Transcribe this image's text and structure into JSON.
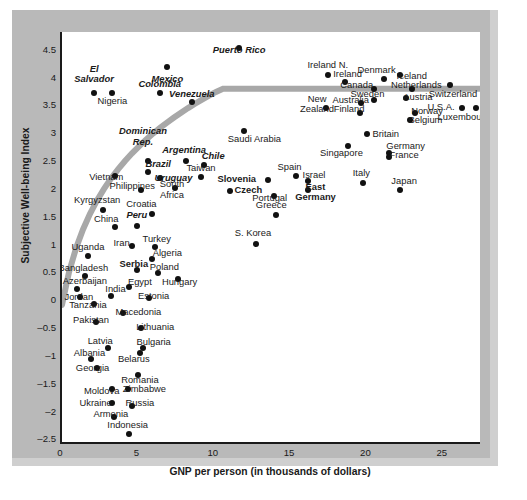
{
  "chart_data": {
    "type": "scatter",
    "title": "",
    "xlabel": "GNP per person (in thousands of dollars)",
    "ylabel": "Subjective Well-being Index",
    "xlim": [
      0,
      27.5
    ],
    "ylim": [
      -2.6,
      4.8
    ],
    "xticks": [
      0,
      5,
      10,
      15,
      20,
      25
    ],
    "yticks": [
      4.5,
      4,
      3.5,
      3,
      2.5,
      2,
      1.5,
      1,
      0.5,
      0,
      -0.5,
      -1,
      -1.5,
      -2,
      -2.5
    ],
    "grid": false,
    "legend": false,
    "trend_line": {
      "description": "logarithmic fit curve",
      "color": "#a8a8a8",
      "width": 6
    },
    "points": [
      {
        "label": "Puerto Rico",
        "x": 11.6,
        "y": 4.52,
        "style": "it",
        "lx": 11.6,
        "ly": 4.38,
        "align": "c",
        "lines": 2
      },
      {
        "label": "Mexico",
        "x": 6.9,
        "y": 4.18,
        "style": "it",
        "lx": 6.9,
        "ly": 3.96,
        "align": "c",
        "lines": 1
      },
      {
        "label": "El\nSalvador",
        "x": 2.1,
        "y": 3.7,
        "style": "it",
        "lx": 2.1,
        "ly": 4.04,
        "align": "c",
        "lines": 2
      },
      {
        "label": "Nigeria",
        "x": 3.3,
        "y": 3.7,
        "style": "",
        "lx": 3.3,
        "ly": 3.55,
        "align": "c",
        "lines": 1
      },
      {
        "label": "Colombia",
        "x": 6.4,
        "y": 3.7,
        "style": "it",
        "lx": 6.4,
        "ly": 3.86,
        "align": "c",
        "lines": 1
      },
      {
        "label": "Venezuela",
        "x": 8.5,
        "y": 3.54,
        "style": "it",
        "lx": 8.5,
        "ly": 3.69,
        "align": "c",
        "lines": 1
      },
      {
        "label": "Ireland N.",
        "x": 17.4,
        "y": 4.02,
        "style": "",
        "lx": 17.4,
        "ly": 4.2,
        "align": "c",
        "lines": 1
      },
      {
        "label": "Ireland",
        "x": 18.5,
        "y": 3.9,
        "style": "",
        "lx": 18.7,
        "ly": 4.04,
        "align": "c",
        "lines": 1
      },
      {
        "label": "Denmark",
        "x": 21.1,
        "y": 3.95,
        "style": "",
        "lx": 20.6,
        "ly": 4.11,
        "align": "c",
        "lines": 1
      },
      {
        "label": "Iceland",
        "x": 22.1,
        "y": 4.02,
        "style": "",
        "lx": 22.9,
        "ly": 4.01,
        "align": "c",
        "lines": 1
      },
      {
        "label": "Canada",
        "x": 20.4,
        "y": 3.78,
        "style": "",
        "lx": 19.3,
        "ly": 3.84,
        "align": "c",
        "lines": 1
      },
      {
        "label": "Netherlands",
        "x": 22.9,
        "y": 3.78,
        "style": "",
        "lx": 23.2,
        "ly": 3.84,
        "align": "c",
        "lines": 1
      },
      {
        "label": "Switzerland",
        "x": 25.4,
        "y": 3.84,
        "style": "",
        "lx": 25.6,
        "ly": 3.68,
        "align": "c",
        "lines": 1
      },
      {
        "label": "Sweden",
        "x": 20.4,
        "y": 3.58,
        "style": "",
        "lx": 20.0,
        "ly": 3.68,
        "align": "c",
        "lines": 1
      },
      {
        "label": "Austria",
        "x": 22.5,
        "y": 3.62,
        "style": "",
        "lx": 23.3,
        "ly": 3.62,
        "align": "c",
        "lines": 1
      },
      {
        "label": "Australia",
        "x": 19.6,
        "y": 3.52,
        "style": "",
        "lx": 18.9,
        "ly": 3.57,
        "align": "c",
        "lines": 1
      },
      {
        "label": "New\nZealand",
        "x": 17.3,
        "y": 3.44,
        "style": "",
        "lx": 16.7,
        "ly": 3.5,
        "align": "c",
        "lines": 2
      },
      {
        "label": "Finland",
        "x": 19.5,
        "y": 3.34,
        "style": "",
        "lx": 18.8,
        "ly": 3.41,
        "align": "c",
        "lines": 1
      },
      {
        "label": "U.S.A.",
        "x": 26.2,
        "y": 3.44,
        "style": "",
        "lx": 25.7,
        "ly": 3.44,
        "align": "r",
        "lines": 1
      },
      {
        "label": "Norway",
        "x": 23.1,
        "y": 3.34,
        "style": "",
        "lx": 23.9,
        "ly": 3.37,
        "align": "c",
        "lines": 1
      },
      {
        "label": "Luxembourg",
        "x": 27.1,
        "y": 3.44,
        "style": "",
        "lx": 26.3,
        "ly": 3.26,
        "align": "c",
        "lines": 1
      },
      {
        "label": "Belgium",
        "x": 22.8,
        "y": 3.22,
        "style": "",
        "lx": 23.8,
        "ly": 3.22,
        "align": "c",
        "lines": 1
      },
      {
        "label": "Saudi Arabia",
        "x": 11.9,
        "y": 3.02,
        "style": "",
        "lx": 12.6,
        "ly": 2.88,
        "align": "c",
        "lines": 1
      },
      {
        "label": "Britain",
        "x": 20.0,
        "y": 2.96,
        "style": "",
        "lx": 21.2,
        "ly": 2.97,
        "align": "c",
        "lines": 1
      },
      {
        "label": "Singapore",
        "x": 18.7,
        "y": 2.76,
        "style": "",
        "lx": 18.3,
        "ly": 2.63,
        "align": "c",
        "lines": 1
      },
      {
        "label": "Germany",
        "x": 21.4,
        "y": 2.62,
        "style": "",
        "lx": 22.5,
        "ly": 2.74,
        "align": "c",
        "lines": 1
      },
      {
        "label": "France",
        "x": 21.4,
        "y": 2.56,
        "style": "",
        "lx": 22.4,
        "ly": 2.58,
        "align": "c",
        "lines": 1
      },
      {
        "label": "Dominican\nRep.",
        "x": 5.6,
        "y": 2.48,
        "style": "it",
        "lx": 5.3,
        "ly": 2.92,
        "align": "c",
        "lines": 2
      },
      {
        "label": "Argentina",
        "x": 8.1,
        "y": 2.48,
        "style": "it",
        "lx": 8.0,
        "ly": 2.68,
        "align": "c",
        "lines": 1
      },
      {
        "label": "Chile",
        "x": 9.3,
        "y": 2.42,
        "style": "it",
        "lx": 9.9,
        "ly": 2.57,
        "align": "c",
        "lines": 1
      },
      {
        "label": "Brazil",
        "x": 5.6,
        "y": 2.28,
        "style": "it",
        "lx": 6.3,
        "ly": 2.42,
        "align": "c",
        "lines": 1
      },
      {
        "label": "Taiwan",
        "x": 9.1,
        "y": 2.2,
        "style": "",
        "lx": 9.1,
        "ly": 2.35,
        "align": "c",
        "lines": 1
      },
      {
        "label": "Vietnam",
        "x": 3.5,
        "y": 2.22,
        "style": "",
        "lx": 2.9,
        "ly": 2.19,
        "align": "c",
        "lines": 1
      },
      {
        "label": "Uruguay",
        "x": 6.4,
        "y": 2.18,
        "style": "it",
        "lx": 7.3,
        "ly": 2.18,
        "align": "c",
        "lines": 1
      },
      {
        "label": "Spain",
        "x": 15.3,
        "y": 2.22,
        "style": "",
        "lx": 14.9,
        "ly": 2.37,
        "align": "c",
        "lines": 1
      },
      {
        "label": "Slovenia",
        "x": 13.5,
        "y": 2.14,
        "style": "bd",
        "lx": 12.7,
        "ly": 2.15,
        "align": "r",
        "lines": 1
      },
      {
        "label": "Israel",
        "x": 16.1,
        "y": 2.12,
        "style": "",
        "lx": 16.5,
        "ly": 2.23,
        "align": "c",
        "lines": 1
      },
      {
        "label": "Italy",
        "x": 19.7,
        "y": 2.08,
        "style": "",
        "lx": 19.6,
        "ly": 2.26,
        "align": "c",
        "lines": 1
      },
      {
        "label": "Japan",
        "x": 22.1,
        "y": 1.96,
        "style": "",
        "lx": 22.4,
        "ly": 2.12,
        "align": "c",
        "lines": 1
      },
      {
        "label": "Philippines",
        "x": 5.2,
        "y": 1.96,
        "style": "",
        "lx": 4.6,
        "ly": 2.03,
        "align": "c",
        "lines": 1
      },
      {
        "label": "South\nAfrica",
        "x": 7.4,
        "y": 2.0,
        "style": "",
        "lx": 7.2,
        "ly": 1.97,
        "align": "c",
        "lines": 2
      },
      {
        "label": "Czech",
        "x": 11.0,
        "y": 1.95,
        "style": "bd",
        "lx": 11.3,
        "ly": 1.95,
        "align": "",
        "lines": 1
      },
      {
        "label": "Portugal",
        "x": 13.9,
        "y": 1.86,
        "style": "",
        "lx": 13.6,
        "ly": 1.81,
        "align": "c",
        "lines": 1
      },
      {
        "label": "East\nGermany",
        "x": 16.1,
        "y": 1.96,
        "style": "bd",
        "lx": 16.6,
        "ly": 1.92,
        "align": "c",
        "lines": 2
      },
      {
        "label": "Kyrgyzstan",
        "x": 2.7,
        "y": 1.6,
        "style": "",
        "lx": 2.3,
        "ly": 1.78,
        "align": "c",
        "lines": 1
      },
      {
        "label": "Croatia",
        "x": 5.9,
        "y": 1.54,
        "style": "",
        "lx": 5.2,
        "ly": 1.71,
        "align": "c",
        "lines": 1
      },
      {
        "label": "Greece",
        "x": 14.0,
        "y": 1.52,
        "style": "",
        "lx": 13.7,
        "ly": 1.68,
        "align": "c",
        "lines": 1
      },
      {
        "label": "China",
        "x": 3.5,
        "y": 1.3,
        "style": "",
        "lx": 2.9,
        "ly": 1.44,
        "align": "c",
        "lines": 1
      },
      {
        "label": "Peru",
        "x": 4.9,
        "y": 1.32,
        "style": "it",
        "lx": 4.9,
        "ly": 1.5,
        "align": "c",
        "lines": 1
      },
      {
        "label": "S. Korea",
        "x": 12.7,
        "y": 1.0,
        "style": "",
        "lx": 12.5,
        "ly": 1.18,
        "align": "c",
        "lines": 1
      },
      {
        "label": "Iran",
        "x": 4.6,
        "y": 0.96,
        "style": "",
        "lx": 3.9,
        "ly": 1.0,
        "align": "c",
        "lines": 1
      },
      {
        "label": "Turkey",
        "x": 6.1,
        "y": 0.94,
        "style": "",
        "lx": 6.2,
        "ly": 1.08,
        "align": "c",
        "lines": 1
      },
      {
        "label": "Uganda",
        "x": 1.7,
        "y": 0.78,
        "style": "",
        "lx": 1.7,
        "ly": 0.94,
        "align": "c",
        "lines": 1
      },
      {
        "label": "Algeria",
        "x": 5.9,
        "y": 0.72,
        "style": "",
        "lx": 6.9,
        "ly": 0.82,
        "align": "c",
        "lines": 1
      },
      {
        "label": "Serbia",
        "x": 4.9,
        "y": 0.52,
        "style": "bd",
        "lx": 4.7,
        "ly": 0.63,
        "align": "c",
        "lines": 1
      },
      {
        "label": "Bangladesh",
        "x": 1.5,
        "y": 0.42,
        "style": "",
        "lx": 1.4,
        "ly": 0.56,
        "align": "c",
        "lines": 1
      },
      {
        "label": "Poland",
        "x": 6.3,
        "y": 0.48,
        "style": "",
        "lx": 6.7,
        "ly": 0.58,
        "align": "c",
        "lines": 1
      },
      {
        "label": "Hungary",
        "x": 7.6,
        "y": 0.36,
        "style": "",
        "lx": 7.7,
        "ly": 0.3,
        "align": "c",
        "lines": 1
      },
      {
        "label": "Azerbaijan",
        "x": 1.0,
        "y": 0.18,
        "style": "",
        "lx": 1.5,
        "ly": 0.32,
        "align": "c",
        "lines": 1
      },
      {
        "label": "Egypt",
        "x": 4.4,
        "y": 0.22,
        "style": "",
        "lx": 5.1,
        "ly": 0.3,
        "align": "c",
        "lines": 1
      },
      {
        "label": "India",
        "x": 3.2,
        "y": 0.06,
        "style": "",
        "lx": 3.5,
        "ly": 0.18,
        "align": "c",
        "lines": 1
      },
      {
        "label": "Jordan",
        "x": 1.2,
        "y": 0.04,
        "style": "",
        "lx": 1.1,
        "ly": 0.03,
        "align": "c",
        "lines": 1
      },
      {
        "label": "Estonia",
        "x": 5.7,
        "y": 0.03,
        "style": "",
        "lx": 6.0,
        "ly": 0.06,
        "align": "c",
        "lines": 1
      },
      {
        "label": "Tanzania",
        "x": 2.1,
        "y": -0.08,
        "style": "",
        "lx": 1.7,
        "ly": -0.1,
        "align": "c",
        "lines": 1
      },
      {
        "label": "Macedonia",
        "x": 4.0,
        "y": -0.24,
        "style": "",
        "lx": 5.0,
        "ly": -0.23,
        "align": "c",
        "lines": 1
      },
      {
        "label": "Pakistan",
        "x": 2.2,
        "y": -0.4,
        "style": "",
        "lx": 1.9,
        "ly": -0.38,
        "align": "c",
        "lines": 1
      },
      {
        "label": "Lithuania",
        "x": 5.2,
        "y": -0.52,
        "style": "",
        "lx": 6.1,
        "ly": -0.51,
        "align": "c",
        "lines": 1
      },
      {
        "label": "Latvia",
        "x": 3.0,
        "y": -0.88,
        "style": "",
        "lx": 2.5,
        "ly": -0.75,
        "align": "c",
        "lines": 1
      },
      {
        "label": "Bulgaria",
        "x": 5.3,
        "y": -0.88,
        "style": "",
        "lx": 6.0,
        "ly": -0.77,
        "align": "c",
        "lines": 1
      },
      {
        "label": "Albania",
        "x": 1.9,
        "y": -1.08,
        "style": "",
        "lx": 1.8,
        "ly": -0.97,
        "align": "c",
        "lines": 1
      },
      {
        "label": "Belarus",
        "x": 5.1,
        "y": -0.96,
        "style": "",
        "lx": 4.7,
        "ly": -1.08,
        "align": "c",
        "lines": 1
      },
      {
        "label": "Georgia",
        "x": 2.3,
        "y": -1.24,
        "style": "",
        "lx": 2.0,
        "ly": -1.24,
        "align": "c",
        "lines": 1
      },
      {
        "label": "Romania",
        "x": 5.0,
        "y": -1.36,
        "style": "",
        "lx": 5.1,
        "ly": -1.46,
        "align": "c",
        "lines": 1
      },
      {
        "label": "Zimbabwe",
        "x": 4.3,
        "y": -1.62,
        "style": "",
        "lx": 5.4,
        "ly": -1.62,
        "align": "c",
        "lines": 1
      },
      {
        "label": "Moldova",
        "x": 3.3,
        "y": -1.62,
        "style": "",
        "lx": 2.6,
        "ly": -1.65,
        "align": "c",
        "lines": 1
      },
      {
        "label": "Ukraine",
        "x": 3.3,
        "y": -1.86,
        "style": "",
        "lx": 2.2,
        "ly": -1.86,
        "align": "c",
        "lines": 1
      },
      {
        "label": "Russia",
        "x": 4.6,
        "y": -1.92,
        "style": "",
        "lx": 5.1,
        "ly": -1.86,
        "align": "c",
        "lines": 1
      },
      {
        "label": "Armenia",
        "x": 3.4,
        "y": -2.12,
        "style": "",
        "lx": 3.2,
        "ly": -2.06,
        "align": "c",
        "lines": 1
      },
      {
        "label": "Indonesia",
        "x": 4.4,
        "y": -2.42,
        "style": "",
        "lx": 4.3,
        "ly": -2.26,
        "align": "c",
        "lines": 1
      }
    ]
  }
}
